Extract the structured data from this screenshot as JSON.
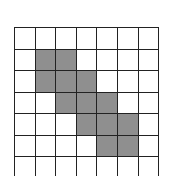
{
  "grid": {
    "cols": 7,
    "rows": 7,
    "cell_w": 20.6,
    "cell_h": 21.5,
    "fill_color": "#8f8f8f",
    "line_color": "#222222",
    "shaded": [
      [
        1,
        1
      ],
      [
        1,
        2
      ],
      [
        2,
        1
      ],
      [
        2,
        2
      ],
      [
        2,
        3
      ],
      [
        3,
        2
      ],
      [
        3,
        3
      ],
      [
        3,
        4
      ],
      [
        4,
        3
      ],
      [
        4,
        4
      ],
      [
        4,
        5
      ],
      [
        5,
        4
      ],
      [
        5,
        5
      ]
    ]
  }
}
